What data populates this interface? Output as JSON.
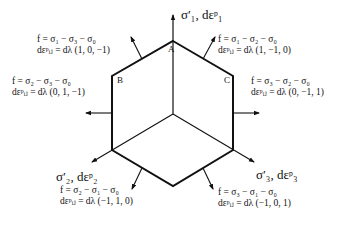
{
  "diagram": {
    "axes": {
      "sigma1": "σ′₁,  dεᵖ₁",
      "sigma2": "σ′₂,  dεᵖ₂",
      "sigma3": "σ′₃,  dεᵖ₃"
    },
    "vertices": {
      "A": "A",
      "B": "B",
      "C": "C"
    },
    "faces": [
      {
        "id": "upper-left",
        "f": "f = σ₁ − σ₃ − σ₀",
        "de": "dεᵖᵢⱼ = dλ (1, 0, −1)"
      },
      {
        "id": "upper-right",
        "f": "f = σ₁ − σ₂ − σ₀",
        "de": "dεᵖᵢⱼ = dλ (1, −1, 0)"
      },
      {
        "id": "left",
        "f": "f = σ₂ − σ₃ − σ₀",
        "de": "dεᵖᵢⱼ = dλ (0, 1, −1)"
      },
      {
        "id": "right",
        "f": "f = σ₃ − σ₂ − σ₀",
        "de": "dεᵖᵢⱼ = dλ (0, −1, 1)"
      },
      {
        "id": "lower-left",
        "f": "f = σ₂ − σ₁ − σ₀",
        "de": "dεᵖᵢⱼ = dλ (−1, 1, 0)"
      },
      {
        "id": "lower-right",
        "f": "f = σ₃ − σ₁ − σ₀",
        "de": "dεᵖᵢⱼ = dλ (−1, 0, 1)"
      }
    ],
    "colors": {
      "line": "#111111",
      "background": "#ffffff"
    }
  }
}
